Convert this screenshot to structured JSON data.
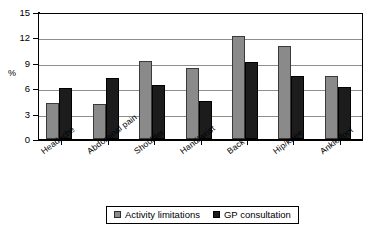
{
  "chart_data": {
    "type": "bar",
    "title": "",
    "xlabel": "",
    "ylabel": "%",
    "ylim": [
      0,
      15
    ],
    "yticks": [
      0,
      3,
      6,
      9,
      12,
      15
    ],
    "grid": true,
    "legend_position": "bottom",
    "categories": [
      "Headache",
      "Abdominal pain",
      "Shoulder",
      "Hand/wrist",
      "Back",
      "Hip/knee",
      "Ankle/foot"
    ],
    "series": [
      {
        "name": "Activity limitations",
        "color": "#8a8a8a",
        "values": [
          4.2,
          4.1,
          9.2,
          8.4,
          12.2,
          11.0,
          7.4
        ]
      },
      {
        "name": "GP consultation",
        "color": "#1c1c1c",
        "values": [
          6.0,
          7.2,
          6.4,
          4.5,
          9.1,
          7.5,
          6.1
        ]
      }
    ]
  },
  "axis": {
    "y_title": "%",
    "y_tick_labels": [
      "15",
      "12",
      "9",
      "6",
      "3",
      "0"
    ]
  },
  "legend": {
    "items": [
      {
        "label": "Activity limitations",
        "swatch": "gray-square-icon"
      },
      {
        "label": "GP consultation",
        "swatch": "black-square-icon"
      }
    ]
  }
}
